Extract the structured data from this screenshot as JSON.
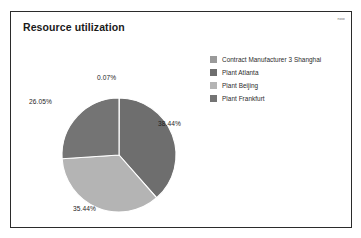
{
  "panel": {
    "title": "Resource utilization",
    "corner_stamp": "now",
    "border_color": "#2b2b2b",
    "background": "#ffffff"
  },
  "legend": {
    "position": "right",
    "items": [
      {
        "label": "Contract Manufacturer 3 Shanghai",
        "color": "#9a9a9a"
      },
      {
        "label": "Plant Atlanta",
        "color": "#6e6e6e"
      },
      {
        "label": "Plant Beijing",
        "color": "#b4b4b4"
      },
      {
        "label": "Plant Frankfurt",
        "color": "#747474"
      }
    ]
  },
  "chart_data": {
    "type": "pie",
    "title": "Resource utilization",
    "xlabel": "",
    "ylabel": "",
    "legend_position": "right",
    "grid": false,
    "start_angle_deg": 0,
    "direction": "clockwise",
    "categories": [
      "Contract Manufacturer 3 Shanghai",
      "Plant Atlanta",
      "Plant Beijing",
      "Plant Frankfurt"
    ],
    "values": [
      0.07,
      38.44,
      35.44,
      26.05
    ],
    "value_labels": [
      "0.07%",
      "38.44%",
      "35.44%",
      "26.05%"
    ],
    "colors": [
      "#9a9a9a",
      "#6e6e6e",
      "#b4b4b4",
      "#747474"
    ],
    "slice_separator_color": "#ffffff",
    "units": "percent",
    "total": 100.0,
    "center": {
      "x": 108,
      "y": 143
    },
    "radius": 57
  }
}
